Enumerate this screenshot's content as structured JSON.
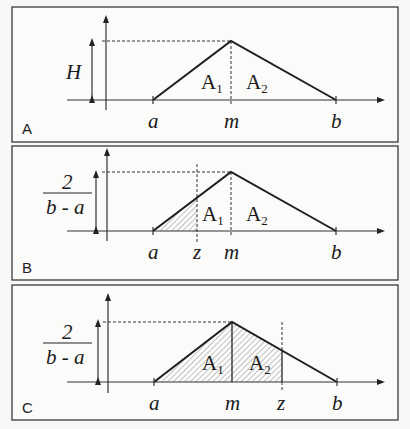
{
  "panels": [
    {
      "id": "A",
      "label": "A",
      "height_label": "H",
      "x_labels": {
        "a": "a",
        "m": "m",
        "b": "b"
      },
      "area_labels": {
        "a1": "A",
        "a1_sub": "1",
        "a2": "A",
        "a2_sub": "2"
      },
      "shaded_region": "none"
    },
    {
      "id": "B",
      "label": "B",
      "height_label": {
        "numerator": "2",
        "denominator": "b - a"
      },
      "x_labels": {
        "a": "a",
        "z": "z",
        "m": "m",
        "b": "b"
      },
      "area_labels": {
        "a1": "A",
        "a1_sub": "1",
        "a2": "A",
        "a2_sub": "2"
      },
      "shaded_region": "a to z (z < m)"
    },
    {
      "id": "C",
      "label": "C",
      "height_label": {
        "numerator": "2",
        "denominator": "b - a"
      },
      "x_labels": {
        "a": "a",
        "m": "m",
        "z": "z",
        "b": "b"
      },
      "area_labels": {
        "a1": "A",
        "a1_sub": "1",
        "a2": "A",
        "a2_sub": "2"
      },
      "shaded_region": "a to z (z > m)"
    }
  ],
  "colors": {
    "line": "#1e1e1e",
    "hatch": "#8a8a8a",
    "background": "#f7f7f5"
  }
}
